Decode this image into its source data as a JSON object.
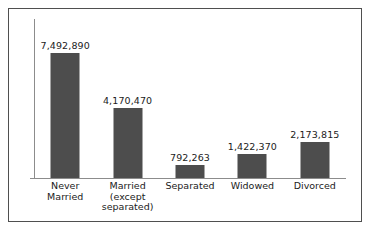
{
  "chart_data": {
    "type": "bar",
    "title": "",
    "subtitle": "",
    "xlabel": "",
    "ylabel": "",
    "grid": false,
    "legend": false,
    "ylim": [
      0,
      7492890
    ],
    "categories": [
      "Never Married",
      "Married (except separated)",
      "Separated",
      "Widowed",
      "Divorced"
    ],
    "category_lines": [
      [
        "Never",
        "Married"
      ],
      [
        "Married",
        "(except",
        "separated)"
      ],
      [
        "Separated"
      ],
      [
        "Widowed"
      ],
      [
        "Divorced"
      ]
    ],
    "values": [
      7492890,
      4170470,
      792263,
      1422370,
      2173815
    ],
    "value_labels": [
      "7,492,890",
      "4,170,470",
      "792,263",
      "1,422,370",
      "2,173,815"
    ],
    "tick_labels": [],
    "annotations": []
  },
  "style": {
    "bar_color": "#4d4d4d",
    "axis_color": "#8c8c8c",
    "border_color": "#4f4f4f",
    "background_color": "#ffffff",
    "text_color": "#1b1b1b"
  }
}
